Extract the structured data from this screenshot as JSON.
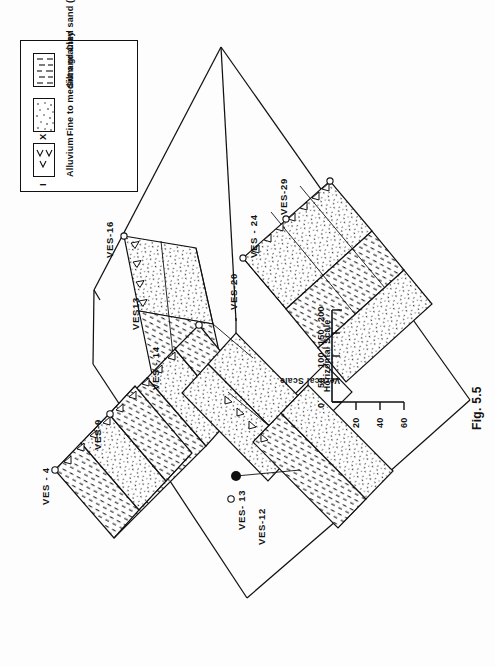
{
  "figure": {
    "caption": "Fig. 5.5",
    "type": "fence-diagram",
    "orientation_note": "page content rotated 90 degrees counter-clockwise"
  },
  "legend": {
    "title": "I N D E X",
    "items": [
      {
        "label": "Alluvium",
        "pattern": "v-marks"
      },
      {
        "label": "Fine to medium grained sand ( with clay bands )",
        "pattern": "stipple-dots"
      },
      {
        "label": "Silt and Clay",
        "pattern": "dashed-lines"
      }
    ]
  },
  "scales": {
    "horizontal": {
      "title": "Horizontal Scale",
      "ticks": [
        "0",
        "50",
        "100",
        "150",
        "200"
      ]
    },
    "vertical": {
      "title": "Vertical Scale",
      "ticks": [
        "20",
        "40",
        "60"
      ]
    }
  },
  "wells": [
    {
      "id": "VES - 4",
      "label": "VES - 4"
    },
    {
      "id": "VES-9",
      "label": "VES-9"
    },
    {
      "id": "VES - 14",
      "label": "VES - 14"
    },
    {
      "id": "VES13",
      "label": "VES13"
    },
    {
      "id": "VES-16",
      "label": "VES-16"
    },
    {
      "id": "VES-20",
      "label": "VES-20"
    },
    {
      "id": "VES - 24",
      "label": "VES - 24"
    },
    {
      "id": "VES-29",
      "label": "VES-29"
    },
    {
      "id": "VES- 13",
      "label": "VES- 13"
    },
    {
      "id": "VES-12",
      "label": "VES-12"
    }
  ],
  "colors": {
    "ink": "#111111",
    "paper": "#ffffff"
  }
}
